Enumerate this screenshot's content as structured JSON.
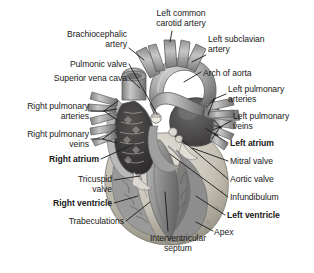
{
  "figure": {
    "type": "anatomical-illustration",
    "style": "grayscale medical illustration",
    "background_color": "#ffffff",
    "text_color": "#1a1a1a",
    "leader_line_color": "#1a1a1a"
  },
  "labels": [
    {
      "id": "left-common-carotid-artery",
      "text": "Left common\ncarotid artery",
      "align": "center",
      "bold": false,
      "x": 146,
      "y": 9,
      "width": 70
    },
    {
      "id": "brachiocephalic-artery",
      "text": "Brachiocephalic\nartery",
      "align": "right",
      "bold": false,
      "x": 53,
      "y": 30,
      "width": 74
    },
    {
      "id": "left-subclavian-artery",
      "text": "Left subclavian\nartery",
      "align": "left",
      "bold": false,
      "x": 208,
      "y": 35,
      "width": 74
    },
    {
      "id": "pulmonic-valve",
      "text": "Pulmonic valve",
      "align": "right",
      "bold": false,
      "x": 58,
      "y": 60,
      "width": 69
    },
    {
      "id": "arch-of-aorta",
      "text": "Arch of aorta",
      "align": "left",
      "bold": false,
      "x": 203,
      "y": 69,
      "width": 64
    },
    {
      "id": "superior-vena-cava",
      "text": "Superior vena cava",
      "align": "right",
      "bold": false,
      "x": 24,
      "y": 74,
      "width": 103
    },
    {
      "id": "left-pulmonary-arteries",
      "text": "Left pulmonary\narteries",
      "align": "left",
      "bold": false,
      "x": 228,
      "y": 85,
      "width": 76
    },
    {
      "id": "right-pulmonary-arteries",
      "text": "Right pulmonary\narteries",
      "align": "right",
      "bold": false,
      "x": 10,
      "y": 102,
      "width": 79
    },
    {
      "id": "left-pulmonary-veins",
      "text": "Left pulmonary\nveins",
      "align": "left",
      "bold": false,
      "x": 233,
      "y": 112,
      "width": 76
    },
    {
      "id": "right-pulmonary-veins",
      "text": "Right pulmonary\nveins",
      "align": "right",
      "bold": false,
      "x": 10,
      "y": 130,
      "width": 79
    },
    {
      "id": "left-atrium",
      "text": "Left atrium",
      "align": "left",
      "bold": true,
      "x": 230,
      "y": 139,
      "width": 60
    },
    {
      "id": "right-atrium",
      "text": "Right atrium",
      "align": "right",
      "bold": true,
      "x": 37,
      "y": 155,
      "width": 62
    },
    {
      "id": "mitral-valve",
      "text": "Mitral valve",
      "align": "left",
      "bold": false,
      "x": 230,
      "y": 157,
      "width": 60
    },
    {
      "id": "aortic-valve",
      "text": "Aortic valve",
      "align": "left",
      "bold": false,
      "x": 230,
      "y": 175,
      "width": 60
    },
    {
      "id": "tricuspid-valve",
      "text": "Tricuspid\nvalve",
      "align": "right",
      "bold": false,
      "x": 63,
      "y": 175,
      "width": 49
    },
    {
      "id": "infundibulum",
      "text": "Infundibulum",
      "align": "left",
      "bold": false,
      "x": 230,
      "y": 193,
      "width": 64
    },
    {
      "id": "right-ventricle",
      "text": "Right ventricle",
      "align": "right",
      "bold": true,
      "x": 41,
      "y": 199,
      "width": 71
    },
    {
      "id": "left-ventricle",
      "text": "Left ventricle",
      "align": "left",
      "bold": true,
      "x": 227,
      "y": 211,
      "width": 70
    },
    {
      "id": "trabeculations",
      "text": "Trabeculations",
      "align": "right",
      "bold": false,
      "x": 52,
      "y": 217,
      "width": 72
    },
    {
      "id": "apex",
      "text": "Apex",
      "align": "left",
      "bold": false,
      "x": 214,
      "y": 228,
      "width": 30
    },
    {
      "id": "interventricular-septum",
      "text": "Interventricular\nseptum",
      "align": "center",
      "bold": false,
      "x": 140,
      "y": 234,
      "width": 76
    }
  ],
  "anatomy_parts": [
    "left common carotid artery",
    "brachiocephalic artery",
    "left subclavian artery",
    "arch of aorta",
    "superior vena cava",
    "pulmonic valve",
    "right pulmonary arteries",
    "left pulmonary arteries",
    "right pulmonary veins",
    "left pulmonary veins",
    "right atrium",
    "left atrium",
    "tricuspid valve",
    "mitral valve",
    "aortic valve",
    "infundibulum",
    "right ventricle",
    "left ventricle",
    "trabeculations",
    "interventricular septum",
    "apex"
  ]
}
